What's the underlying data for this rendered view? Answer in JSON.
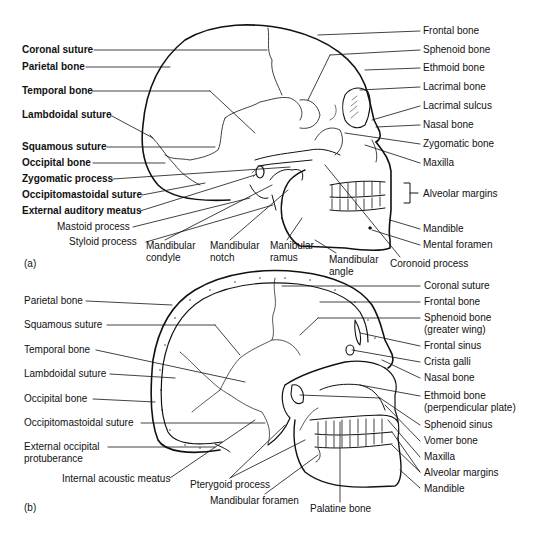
{
  "figure": {
    "panel_a": {
      "tag": "(a)",
      "view": "lateral",
      "left_labels": [
        {
          "text": "Coronal suture",
          "x": 22,
          "y": 44,
          "bold": true
        },
        {
          "text": "Parietal bone",
          "x": 22,
          "y": 61,
          "bold": true
        },
        {
          "text": "Temporal bone",
          "x": 22,
          "y": 85,
          "bold": true
        },
        {
          "text": "Lambdoidal suture",
          "x": 22,
          "y": 109,
          "bold": true
        },
        {
          "text": "Squamous suture",
          "x": 22,
          "y": 141,
          "bold": true
        },
        {
          "text": "Occipital bone",
          "x": 22,
          "y": 157,
          "bold": true
        },
        {
          "text": "Zygomatic process",
          "x": 22,
          "y": 173,
          "bold": true
        },
        {
          "text": "Occipitomastoidal suture",
          "x": 22,
          "y": 189,
          "bold": true
        },
        {
          "text": "External auditory meatus",
          "x": 22,
          "y": 205,
          "bold": true
        },
        {
          "text": "Mastoid process",
          "x": 57,
          "y": 221,
          "bold": false
        },
        {
          "text": "Styloid process",
          "x": 69,
          "y": 236,
          "bold": false
        }
      ],
      "bottom_labels": [
        {
          "text": "Mandibular\ncondyle",
          "x": 146,
          "y": 240
        },
        {
          "text": "Mandibular\nnotch",
          "x": 210,
          "y": 240
        },
        {
          "text": "Manibular\nramus",
          "x": 270,
          "y": 240
        },
        {
          "text": "Mandibular\nangle",
          "x": 329,
          "y": 254
        },
        {
          "text": "Coronoid process",
          "x": 390,
          "y": 258
        }
      ],
      "right_labels": [
        {
          "text": "Frontal bone",
          "x": 423,
          "y": 25
        },
        {
          "text": "Sphenoid bone",
          "x": 423,
          "y": 44
        },
        {
          "text": "Ethmoid bone",
          "x": 423,
          "y": 62
        },
        {
          "text": "Lacrimal bone",
          "x": 423,
          "y": 81
        },
        {
          "text": "Lacrimal sulcus",
          "x": 423,
          "y": 100
        },
        {
          "text": "Nasal bone",
          "x": 423,
          "y": 119
        },
        {
          "text": "Zygomatic bone",
          "x": 423,
          "y": 138
        },
        {
          "text": "Maxilla",
          "x": 423,
          "y": 157
        },
        {
          "text": "Alveolar margins",
          "x": 423,
          "y": 192
        },
        {
          "text": "Mandible",
          "x": 423,
          "y": 223
        },
        {
          "text": "Mental foramen",
          "x": 423,
          "y": 239
        }
      ]
    },
    "panel_b": {
      "tag": "(b)",
      "view": "sagittal section",
      "left_labels": [
        {
          "text": "Parietal bone",
          "x": 24,
          "y": 295
        },
        {
          "text": "Squamous suture",
          "x": 24,
          "y": 319
        },
        {
          "text": "Temporal bone",
          "x": 24,
          "y": 344
        },
        {
          "text": "Lambdoidal suture",
          "x": 24,
          "y": 368
        },
        {
          "text": "Occipital bone",
          "x": 24,
          "y": 393
        },
        {
          "text": "Occipitomastoidal suture",
          "x": 24,
          "y": 417
        },
        {
          "text": "External occipital\nprotuberance",
          "x": 24,
          "y": 441
        }
      ],
      "bottom_labels": [
        {
          "text": "Internal acoustic meatus",
          "x": 62,
          "y": 473
        },
        {
          "text": "Pterygoid process",
          "x": 190,
          "y": 479
        },
        {
          "text": "Mandibular foramen",
          "x": 210,
          "y": 495
        },
        {
          "text": "Palatine bone",
          "x": 310,
          "y": 503
        }
      ],
      "right_labels": [
        {
          "text": "Coronal suture",
          "x": 424,
          "y": 280
        },
        {
          "text": "Frontal bone",
          "x": 424,
          "y": 296
        },
        {
          "text": "Sphenoid bone\n(greater wing)",
          "x": 424,
          "y": 312
        },
        {
          "text": "Frontal sinus",
          "x": 424,
          "y": 340
        },
        {
          "text": "Crista galli",
          "x": 424,
          "y": 356
        },
        {
          "text": "Nasal bone",
          "x": 424,
          "y": 372
        },
        {
          "text": "Ethmoid bone\n(perpendicular plate)",
          "x": 424,
          "y": 390
        },
        {
          "text": "Sphenoid sinus",
          "x": 424,
          "y": 419
        },
        {
          "text": "Vomer bone",
          "x": 424,
          "y": 435
        },
        {
          "text": "Maxilla",
          "x": 424,
          "y": 451
        },
        {
          "text": "Alveolar margins",
          "x": 424,
          "y": 467
        },
        {
          "text": "Mandible",
          "x": 424,
          "y": 483
        }
      ]
    }
  }
}
